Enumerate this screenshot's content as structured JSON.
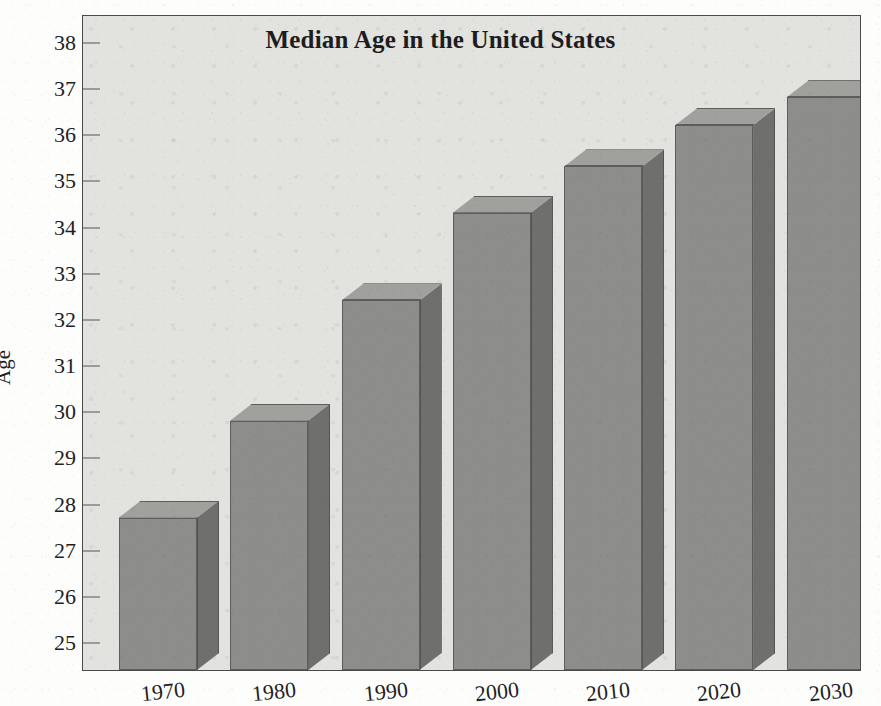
{
  "chart_data": {
    "type": "bar",
    "title": "Median Age in the United States",
    "xlabel": "",
    "ylabel": "Age",
    "categories": [
      "1970",
      "1980",
      "1990",
      "2000",
      "2010",
      "2020",
      "2030"
    ],
    "values": [
      27.7,
      29.8,
      32.4,
      34.3,
      35.3,
      36.2,
      36.8
    ],
    "ylim": [
      24.4,
      38.6
    ],
    "ytick_labels": [
      "38",
      "37",
      "36",
      "35",
      "34",
      "33",
      "32",
      "31",
      "30",
      "29",
      "28",
      "27",
      "26",
      "25"
    ],
    "ytick_values": [
      38,
      37,
      36,
      35,
      34,
      33,
      32,
      31,
      30,
      29,
      28,
      27,
      26,
      25
    ],
    "grid": false,
    "legend": "none",
    "style": "3d-bar",
    "colors": {
      "bar_front": "#8d8d8b",
      "bar_top": "#a0a09d",
      "bar_side": "#6f6f6d",
      "plot_background": "#e2e2de",
      "axis": "#4a4a4a",
      "text": "#1f1f1f"
    }
  },
  "figure": {
    "background": "#fdfdfc"
  }
}
